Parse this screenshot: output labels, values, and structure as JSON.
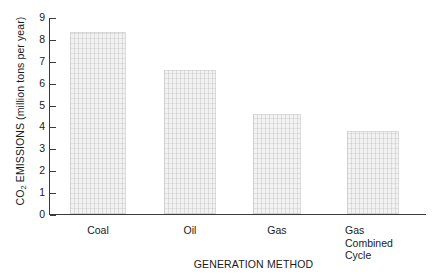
{
  "chart_data": {
    "type": "bar",
    "title": "",
    "categories": [
      "Coal",
      "Oil",
      "Gas",
      "Gas\nCombined\nCycle"
    ],
    "values": [
      8.3,
      6.6,
      4.55,
      3.8
    ],
    "series": [
      {
        "name": "CO2 Emissions",
        "values": [
          8.3,
          6.6,
          4.55,
          3.8
        ]
      }
    ],
    "xlabel": "GENERATION METHOD",
    "ylabel": "CO2 EMISSIONS (million tons per year)",
    "ylim": [
      0,
      9
    ],
    "ytick_labels": [
      "9",
      "8",
      "7",
      "6",
      "5",
      "4",
      "3",
      "2",
      "1",
      "0"
    ],
    "ytick_values": [
      9,
      8,
      7,
      6,
      5,
      4,
      3,
      2,
      1,
      0
    ],
    "grid": false,
    "legend": "none",
    "bar_fill_color": "#f2f2f2",
    "axis_color": "#3a3a3a",
    "text_color": "#1a1a1a",
    "background_color": "#ffffff"
  },
  "axes": {
    "y_title_prefix": "CO",
    "y_title_subscript": "2",
    "y_title_suffix": " EMISSIONS (million tons per year)",
    "x_title": "GENERATION METHOD"
  },
  "bars": [
    {
      "category": "Coal",
      "label": "Coal",
      "value": 8.3
    },
    {
      "category": "Oil",
      "label": "Oil",
      "value": 6.6
    },
    {
      "category": "Gas",
      "label": "Gas",
      "value": 4.55
    },
    {
      "category": "Gas Combined Cycle",
      "label": "Gas\nCombined\nCycle",
      "value": 3.8
    }
  ],
  "ticks": [
    {
      "label": "9",
      "value": 9
    },
    {
      "label": "8",
      "value": 8
    },
    {
      "label": "7",
      "value": 7
    },
    {
      "label": "6",
      "value": 6
    },
    {
      "label": "5",
      "value": 5
    },
    {
      "label": "4",
      "value": 4
    },
    {
      "label": "3",
      "value": 3
    },
    {
      "label": "2",
      "value": 2
    },
    {
      "label": "1",
      "value": 1
    },
    {
      "label": "0",
      "value": 0
    }
  ]
}
